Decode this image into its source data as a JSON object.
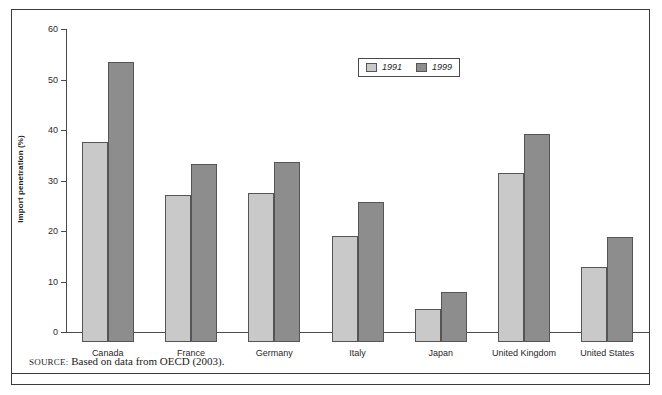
{
  "chart_data": {
    "type": "bar",
    "title": "",
    "subtitle": "",
    "xlabel": "",
    "ylabel": "Import penetration (%)",
    "ylim": [
      0,
      60
    ],
    "yticks": [
      0,
      10,
      20,
      30,
      40,
      50,
      60
    ],
    "ytick_labels": [
      "0",
      "10",
      "20",
      "30",
      "40",
      "50",
      "60"
    ],
    "grid": false,
    "legend_position": "top-center",
    "categories": [
      "Canada",
      "France",
      "Germany",
      "Italy",
      "Japan",
      "United Kingdom",
      "United States"
    ],
    "series": [
      {
        "name": "1991",
        "color": "#c9c9c9",
        "values": [
          39.7,
          29.2,
          29.5,
          21.0,
          6.5,
          33.5,
          14.8
        ]
      },
      {
        "name": "1999",
        "color": "#8d8d8d",
        "values": [
          55.4,
          35.3,
          35.7,
          27.8,
          10.0,
          41.2,
          20.7
        ]
      }
    ],
    "annotations": []
  },
  "legend": {
    "entries": [
      {
        "label": "1991",
        "swatch": "legend-swatch-1991"
      },
      {
        "label": "1999",
        "swatch": "legend-swatch-1999"
      }
    ]
  },
  "source": {
    "label": "SOURCE:",
    "text": "Based on data from OECD (2003)."
  },
  "colors": {
    "series_1991": "#c9c9c9",
    "series_1999": "#8d8d8d",
    "axis": "#4a4a4a",
    "frame": "#3a3a3a",
    "text": "#1f1f1f"
  }
}
